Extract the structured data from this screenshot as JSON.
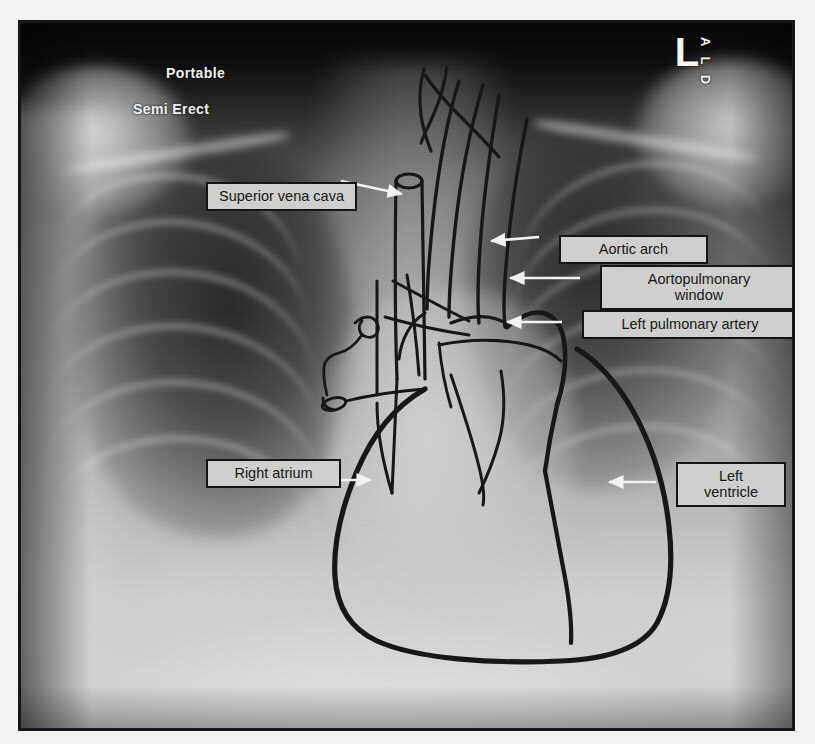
{
  "image": {
    "modality": "chest-radiograph",
    "view": "frontal AP chest",
    "technique_markings": [
      {
        "name": "portable",
        "text": "Portable"
      },
      {
        "name": "semi-erect",
        "text": "Semi Erect"
      }
    ],
    "side_marker": {
      "primary": "L",
      "stacked": "A L D"
    }
  },
  "annotations": [
    {
      "id": "superior-vena-cava",
      "label": "Superior vena cava",
      "arrow_direction": "right",
      "box": {
        "x": 185,
        "y": 159,
        "w": 151
      },
      "arrow": {
        "x1": 338,
        "y1": 178,
        "x2": 399,
        "y2": 191
      },
      "target": "right superior mediastinal border"
    },
    {
      "id": "aortic-arch",
      "label": "Aortic arch",
      "arrow_direction": "left",
      "box": {
        "x": 538,
        "y": 212,
        "w": 149
      },
      "arrow": {
        "x1": 536,
        "y1": 234,
        "x2": 490,
        "y2": 237
      },
      "target": "aortic knob"
    },
    {
      "id": "aortopulmonary-window",
      "label": "Aortopulmonary\nwindow",
      "arrow_direction": "left",
      "box": {
        "x": 579,
        "y": 242,
        "w": 198
      },
      "arrow": {
        "x1": 577,
        "y1": 275,
        "x2": 508,
        "y2": 275
      },
      "target": "concavity below aortic knob"
    },
    {
      "id": "left-pulmonary-artery",
      "label": "Left pulmonary artery",
      "arrow_direction": "left",
      "box": {
        "x": 561,
        "y": 287,
        "w": 216
      },
      "arrow": {
        "x1": 559,
        "y1": 319,
        "x2": 505,
        "y2": 319
      },
      "target": "left hilum"
    },
    {
      "id": "right-atrium",
      "label": "Right atrium",
      "arrow_direction": "right",
      "box": {
        "x": 185,
        "y": 436,
        "w": 135
      },
      "arrow": {
        "x1": 322,
        "y1": 477,
        "x2": 369,
        "y2": 477
      },
      "target": "right heart border"
    },
    {
      "id": "left-ventricle",
      "label": "Left\nventricle",
      "arrow_direction": "left",
      "box": {
        "x": 655,
        "y": 439,
        "w": 110
      },
      "arrow": {
        "x1": 653,
        "y1": 479,
        "x2": 607,
        "y2": 479
      },
      "target": "left heart border"
    }
  ],
  "colors": {
    "label_fill": "#cfcfcd",
    "label_border": "#141414",
    "label_text": "#17171a",
    "arrow": "#f2f2f2",
    "burned_text": "#f2f2f2",
    "overlay_trace": "#1a1a1a",
    "page_background": "#f2f2f0",
    "frame_border": "#16161a"
  }
}
